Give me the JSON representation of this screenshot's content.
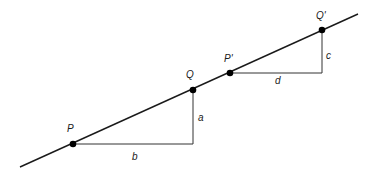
{
  "diagram": {
    "type": "line-slope-triangles",
    "colors": {
      "line": "#1a1a1a",
      "triangle": "#333333",
      "point": "#000000"
    },
    "line": {
      "x1": 20,
      "y1": 167,
      "x2": 358,
      "y2": 14
    },
    "points": [
      {
        "id": "P",
        "label": "P",
        "x": 73,
        "y": 144
      },
      {
        "id": "Q",
        "label": "Q",
        "x": 193,
        "y": 90
      },
      {
        "id": "P2",
        "label": "P'",
        "x": 230,
        "y": 73
      },
      {
        "id": "Q2",
        "label": "Q'",
        "x": 322,
        "y": 30
      }
    ],
    "triangles": [
      {
        "from": "P",
        "to": "Q",
        "horizontal_label": "b",
        "vertical_label": "a"
      },
      {
        "from": "P2",
        "to": "Q2",
        "horizontal_label": "d",
        "vertical_label": "c"
      }
    ],
    "labels": {
      "P": "P",
      "Q": "Q",
      "P2": "P'",
      "Q2": "Q'",
      "a": "a",
      "b": "b",
      "c": "c",
      "d": "d"
    }
  }
}
